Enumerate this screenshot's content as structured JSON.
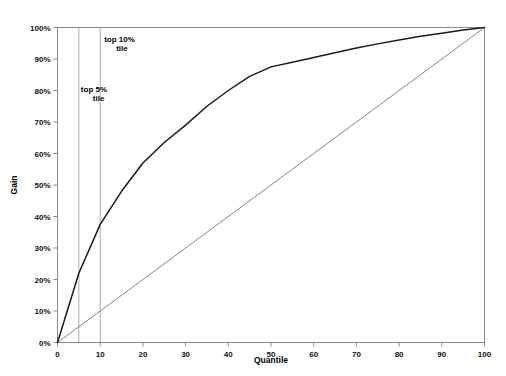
{
  "chart_data": {
    "type": "line",
    "title": "",
    "xlabel": "Quantile",
    "ylabel": "Gain",
    "xlim": [
      0,
      100
    ],
    "ylim": [
      0,
      100
    ],
    "grid": false,
    "legend": "none",
    "x_ticks": [
      0,
      10,
      20,
      30,
      40,
      50,
      60,
      70,
      80,
      90,
      100
    ],
    "x_tick_labels": [
      "0",
      "10",
      "20",
      "30",
      "40",
      "50",
      "60",
      "70",
      "80",
      "90",
      "100"
    ],
    "y_ticks": [
      0,
      10,
      20,
      30,
      40,
      50,
      60,
      70,
      80,
      90,
      100
    ],
    "y_tick_labels": [
      "0%",
      "10%",
      "20%",
      "30%",
      "40%",
      "50%",
      "60%",
      "70%",
      "80%",
      "90%",
      "100%"
    ],
    "series": [
      {
        "name": "Cumulative Gain",
        "x": [
          0,
          5,
          10,
          15,
          20,
          25,
          30,
          35,
          40,
          45,
          50,
          55,
          60,
          65,
          70,
          75,
          80,
          85,
          90,
          95,
          100
        ],
        "values": [
          0,
          22,
          37.5,
          48,
          57,
          63.5,
          69,
          75,
          80,
          84.5,
          87.5,
          89,
          90.5,
          92,
          93.5,
          94.8,
          96,
          97.2,
          98.2,
          99.2,
          100
        ]
      },
      {
        "name": "Baseline",
        "x": [
          0,
          100
        ],
        "values": [
          0,
          100
        ]
      }
    ],
    "annotations": [
      {
        "label_line1": "top 5%",
        "label_line2": "tile",
        "x": 5
      },
      {
        "label_line1": "top 10%",
        "label_line2": "tile",
        "x": 10
      }
    ],
    "reference_lines": [
      5,
      10
    ],
    "colors": {
      "curve": "#1a1a1a",
      "baseline": "#666666",
      "reference": "#9a9a9a",
      "frame": "#8a8a8a",
      "text": "#000000",
      "background": "#ffffff"
    }
  }
}
